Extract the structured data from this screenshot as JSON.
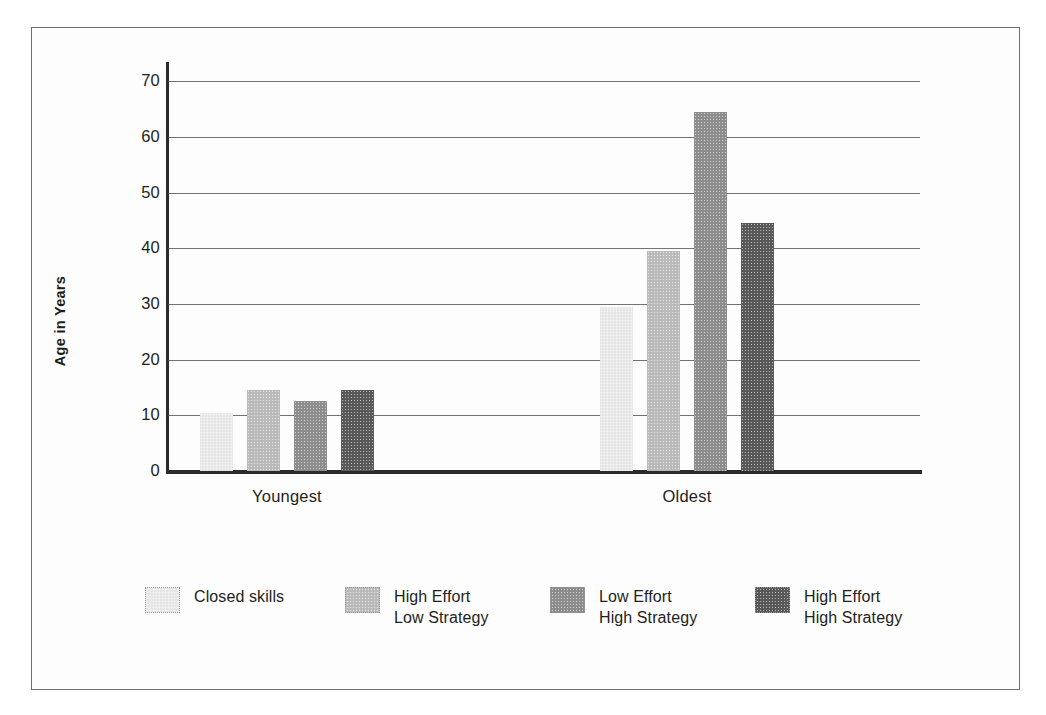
{
  "figure": {
    "y_axis_title": "Age in Years",
    "frame_color": "#6e6e6e"
  },
  "chart_data": {
    "type": "bar",
    "title": "",
    "xlabel": "",
    "ylabel": "Age in Years",
    "categories": [
      "Youngest",
      "Oldest"
    ],
    "ylim": [
      0,
      72
    ],
    "yticks": [
      0,
      10,
      20,
      30,
      40,
      50,
      60,
      70
    ],
    "ytick_labels": [
      "0",
      "10",
      "20",
      "30",
      "40",
      "50",
      "60",
      "70"
    ],
    "grid": true,
    "legend_position": "bottom",
    "series": [
      {
        "name": "Closed skills",
        "color": "#ebebeb",
        "values": [
          10.5,
          29.5
        ]
      },
      {
        "name": "High Effort Low Strategy",
        "color": "#bdbdbd",
        "values": [
          14.5,
          39.5
        ]
      },
      {
        "name": "Low Effort High Strategy",
        "color": "#8f8f8f",
        "values": [
          12.5,
          64.5
        ]
      },
      {
        "name": "High Effort High Strategy",
        "color": "#5a5a5a",
        "values": [
          14.5,
          44.5
        ]
      }
    ]
  },
  "legend": {
    "items": [
      {
        "line1": "Closed skills",
        "line2": "",
        "color": "#ebebeb"
      },
      {
        "line1": "High Effort",
        "line2": "Low Strategy",
        "color": "#bdbdbd"
      },
      {
        "line1": "Low Effort",
        "line2": "High Strategy",
        "color": "#8f8f8f"
      },
      {
        "line1": "High Effort",
        "line2": "High Strategy",
        "color": "#5a5a5a"
      }
    ]
  }
}
